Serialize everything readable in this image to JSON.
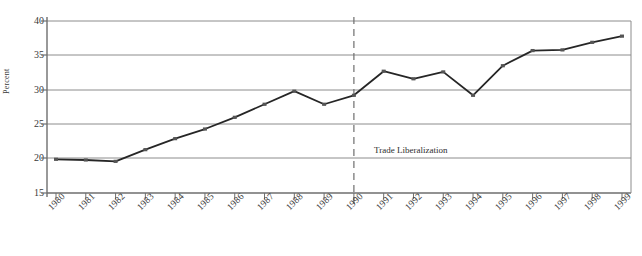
{
  "chart_data": {
    "type": "line",
    "title": "",
    "xlabel": "",
    "ylabel": "Percent",
    "categories": [
      "1980",
      "1981",
      "1982",
      "1983",
      "1984",
      "1985",
      "1986",
      "1987",
      "1988",
      "1989",
      "1990",
      "1991",
      "1992",
      "1993",
      "1994",
      "1995",
      "1996",
      "1997",
      "1998",
      "1999"
    ],
    "values": [
      19.9,
      19.8,
      19.6,
      21.3,
      22.9,
      24.3,
      26.0,
      27.9,
      29.8,
      27.9,
      29.2,
      32.7,
      31.6,
      32.6,
      29.2,
      33.5,
      35.7,
      35.8,
      36.9,
      37.8
    ],
    "ylim": [
      15,
      40
    ],
    "yticks": [
      15,
      20,
      25,
      30,
      35,
      40
    ],
    "ytick_labels": [
      "15",
      "20",
      "25",
      "30",
      "35",
      "40"
    ],
    "grid": true,
    "legend": "none",
    "series": [
      {
        "name": "Percent",
        "values": [
          19.9,
          19.8,
          19.6,
          21.3,
          22.9,
          24.3,
          26.0,
          27.9,
          29.8,
          27.9,
          29.2,
          32.7,
          31.6,
          32.6,
          29.2,
          33.5,
          35.7,
          35.8,
          36.9,
          37.8
        ]
      }
    ],
    "annotations": [
      {
        "text": "Trade Liberalization",
        "x_category": "1990",
        "type": "vertical-dashed-line-label"
      }
    ],
    "colors": {
      "line": "#262626",
      "marker": "#555555",
      "grid": "#8c8c8c",
      "axis": "#6e6e6e",
      "annotation_line": "#6e6e6e",
      "text": "#3a3a3a"
    }
  }
}
